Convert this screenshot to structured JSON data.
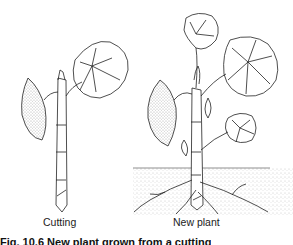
{
  "figure": {
    "panels": [
      {
        "id": "cutting",
        "label": "Cutting"
      },
      {
        "id": "new-plant",
        "label": "New plant"
      }
    ],
    "caption": "Fig. 10.6 New plant grown from a cutting"
  }
}
